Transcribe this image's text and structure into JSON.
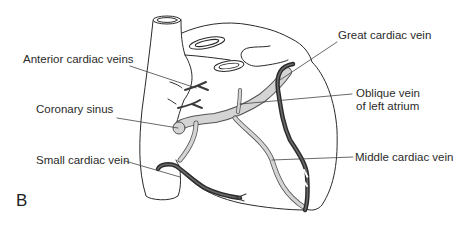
{
  "figure": {
    "panel_letter": "B",
    "labels": [
      {
        "id": "anterior-cardiac-veins",
        "text": "Anterior cardiac veins"
      },
      {
        "id": "coronary-sinus",
        "text": "Coronary sinus"
      },
      {
        "id": "small-cardiac-vein",
        "text": "Small cardiac vein"
      },
      {
        "id": "great-cardiac-vein",
        "text": "Great cardiac vein"
      },
      {
        "id": "oblique-vein-line1",
        "text": "Oblique vein"
      },
      {
        "id": "oblique-vein-line2",
        "text": "of left atrium"
      },
      {
        "id": "middle-cardiac-vein",
        "text": "Middle cardiac vein"
      }
    ],
    "colors": {
      "outline": "#2a2a2a",
      "dark_vein": "#3a3a3a",
      "light_vein": "#d4d4d4",
      "leader_line": "#444444",
      "background": "#ffffff"
    }
  }
}
